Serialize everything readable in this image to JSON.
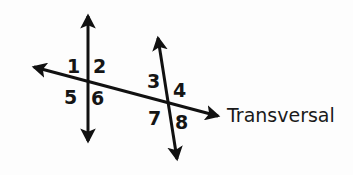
{
  "figure": {
    "background_color": "#fdfdfd",
    "stroke_color": "#111111",
    "text_color": "#151515"
  },
  "lines": [
    {
      "id": "vertical-line",
      "name": "vertical-line",
      "x1": 88,
      "y1": 16,
      "x2": 88,
      "y2": 141,
      "arrow_start": true,
      "arrow_end": true,
      "stroke_width": 3
    },
    {
      "id": "slanted-line",
      "name": "slanted-line",
      "x1": 158,
      "y1": 38,
      "x2": 177,
      "y2": 159,
      "arrow_start": true,
      "arrow_end": true,
      "stroke_width": 3
    },
    {
      "id": "transversal-line",
      "name": "transversal-line",
      "x1": 34,
      "y1": 67,
      "x2": 218,
      "y2": 116,
      "arrow_start": true,
      "arrow_end": true,
      "stroke_width": 3
    }
  ],
  "intersections": [
    {
      "name": "intersection-left",
      "x": 88,
      "y": 81
    },
    {
      "name": "intersection-right",
      "x": 170,
      "y": 106
    }
  ],
  "angle_labels": [
    {
      "id": "angle-1",
      "text": "1",
      "x": 67,
      "y": 57
    },
    {
      "id": "angle-2",
      "text": "2",
      "x": 93,
      "y": 57
    },
    {
      "id": "angle-3",
      "text": "3",
      "x": 147,
      "y": 72
    },
    {
      "id": "angle-4",
      "text": "4",
      "x": 173,
      "y": 81
    },
    {
      "id": "angle-5",
      "text": "5",
      "x": 64,
      "y": 88
    },
    {
      "id": "angle-6",
      "text": "6",
      "x": 91,
      "y": 89
    },
    {
      "id": "angle-7",
      "text": "7",
      "x": 148,
      "y": 109
    },
    {
      "id": "angle-8",
      "text": "8",
      "x": 175,
      "y": 113
    }
  ],
  "annotations": [
    {
      "id": "transversal-caption",
      "name": "transversal-label",
      "text": "Transversal",
      "x": 227,
      "y": 106
    }
  ]
}
